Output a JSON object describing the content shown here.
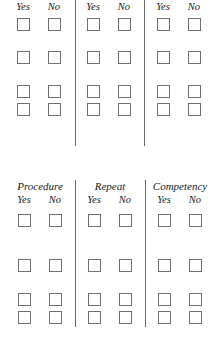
{
  "top_section": {
    "columns": [
      {
        "heading": "",
        "yes_label": "Yes",
        "no_label": "No"
      },
      {
        "heading": "",
        "yes_label": "Yes",
        "no_label": "No"
      },
      {
        "heading": "",
        "yes_label": "Yes",
        "no_label": "No"
      }
    ],
    "rows": 4
  },
  "bottom_section": {
    "columns": [
      {
        "heading": "Procedure",
        "yes_label": "Yes",
        "no_label": "No"
      },
      {
        "heading": "Repeat",
        "yes_label": "Yes",
        "no_label": "No"
      },
      {
        "heading": "Competency",
        "yes_label": "Yes",
        "no_label": "No"
      }
    ],
    "rows": 4
  },
  "colors": {
    "divider": "#6a6a6a",
    "checkbox_border": "#707070",
    "text": "#1a1a1a",
    "background": "#ffffff"
  }
}
